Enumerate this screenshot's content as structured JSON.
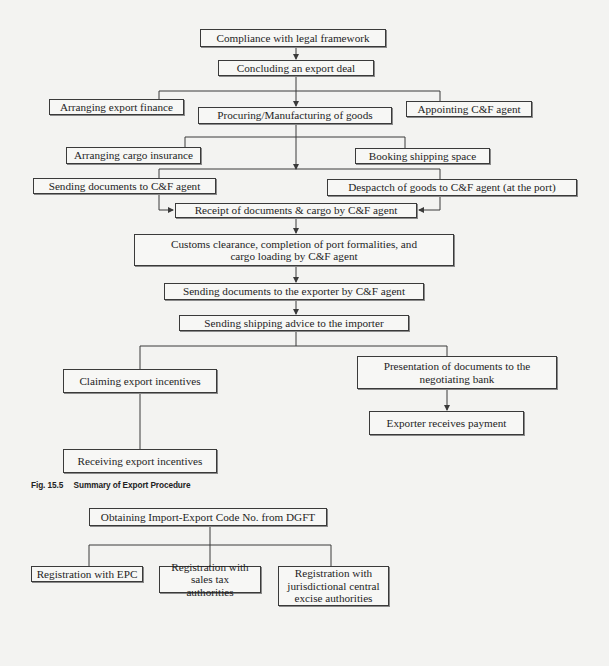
{
  "figure": {
    "caption_number": "Fig. 15.5",
    "caption_title": "Summary of Export Procedure"
  },
  "flowchart": {
    "nodes": {
      "compliance": "Compliance with legal framework",
      "concluding": "Concluding an export deal",
      "export_finance": "Arranging export finance",
      "procuring": "Procuring/Manufacturing of goods",
      "appointing_cf": "Appointing C&F agent",
      "cargo_insurance": "Arranging cargo insurance",
      "booking_space": "Booking shipping space",
      "sending_docs_cf": "Sending documents to C&F agent",
      "despatch_goods": "Despactch of goods to C&F agent (at the port)",
      "receipt_docs": "Receipt of documents & cargo by C&F agent",
      "customs": "Customs clearance, completion of port formalities, and cargo loading by C&F agent",
      "sending_docs_exporter": "Sending documents to the exporter by C&F agent",
      "shipping_advice": "Sending shipping advice to the importer",
      "claiming_incentives": "Claiming export incentives",
      "presentation_docs": "Presentation of documents to the negotiating bank",
      "receives_payment": "Exporter receives payment",
      "receiving_incentives": "Receiving export incentives"
    }
  },
  "registration_tree": {
    "nodes": {
      "iec": "Obtaining Import-Export Code No. from DGFT",
      "epc": "Registration with EPC",
      "sales_tax": "Registration with sales tax authorities",
      "excise": "Registration with jurisdictional central excise authorities"
    }
  },
  "colors": {
    "line": "#3a3a3a",
    "box_border": "#3a3a3a",
    "background": "#f3f3f1"
  }
}
